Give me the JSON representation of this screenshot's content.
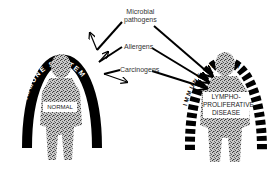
{
  "diagram": {
    "left_panel": {
      "arch_label": "IMMUNE SYSTEM",
      "figure_label": "NORMAL",
      "arch_style": "solid"
    },
    "right_panel": {
      "arch_label": "IMMUNE SYSTEM",
      "figure_label_lines": [
        "LYMPHO-",
        "PROLIFERATIVE",
        "DISEASE"
      ],
      "arch_style": "dashed"
    },
    "agents": [
      {
        "label_lines": [
          "Microbial",
          "pathogens"
        ],
        "left_effect": "deflected",
        "right_effect": "penetrates"
      },
      {
        "label_lines": [
          "Allergens"
        ],
        "left_effect": "deflected",
        "right_effect": "penetrates"
      },
      {
        "label_lines": [
          "Carcinogens"
        ],
        "left_effect": "deflected",
        "right_effect": "penetrates"
      }
    ],
    "colors": {
      "arch": "#000000",
      "figure": "#8a8a8a",
      "background": "#ffffff",
      "text": "#333333"
    }
  }
}
